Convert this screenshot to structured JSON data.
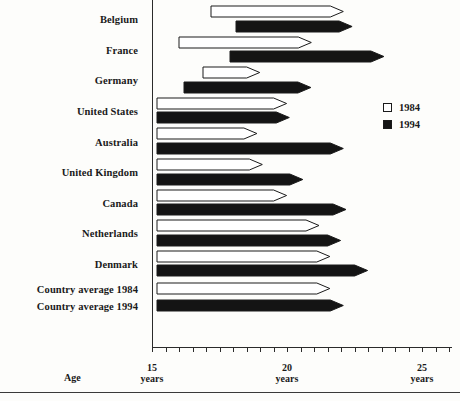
{
  "chart_data": {
    "type": "bar",
    "title": "",
    "subtitle": "",
    "orientation": "horizontal",
    "xlabel": "Age",
    "ylabel": "",
    "xlim": [
      15,
      26
    ],
    "x_tick_values": [
      15,
      20,
      25
    ],
    "x_tick_labels": [
      "15\nyears",
      "20\nyears",
      "25\nyears"
    ],
    "x_minor_tick_step": 0.5,
    "grid": false,
    "legend_position": "right",
    "legend": [
      {
        "label": "1984",
        "style": "open"
      },
      {
        "label": "1994",
        "style": "filled"
      }
    ],
    "categories": [
      "Belgium",
      "France",
      "Germany",
      "United States",
      "Australia",
      "United Kingdom",
      "Canada",
      "Netherlands",
      "Denmark",
      "Country average 1984",
      "Country average 1994"
    ],
    "series": [
      {
        "name": "1984",
        "style": "open",
        "values": [
          {
            "category": "Belgium",
            "start": 17.2,
            "end": 22.1
          },
          {
            "category": "France",
            "start": 16.0,
            "end": 20.9
          },
          {
            "category": "Germany",
            "start": 16.9,
            "end": 19.0
          },
          {
            "category": "United States",
            "start": 15.2,
            "end": 20.0
          },
          {
            "category": "Australia",
            "start": 15.2,
            "end": 18.9
          },
          {
            "category": "United Kingdom",
            "start": 15.2,
            "end": 19.1
          },
          {
            "category": "Canada",
            "start": 15.2,
            "end": 20.0
          },
          {
            "category": "Netherlands",
            "start": 15.2,
            "end": 21.2
          },
          {
            "category": "Denmark",
            "start": 15.2,
            "end": 21.6
          },
          {
            "category": "Country average 1984",
            "start": 15.2,
            "end": 21.6
          },
          {
            "category": "Country average 1994",
            "start": null,
            "end": null
          }
        ]
      },
      {
        "name": "1994",
        "style": "filled",
        "values": [
          {
            "category": "Belgium",
            "start": 18.1,
            "end": 22.4
          },
          {
            "category": "France",
            "start": 17.9,
            "end": 23.6
          },
          {
            "category": "Germany",
            "start": 16.2,
            "end": 20.9
          },
          {
            "category": "United States",
            "start": 15.2,
            "end": 20.1
          },
          {
            "category": "Australia",
            "start": 15.2,
            "end": 22.1
          },
          {
            "category": "United Kingdom",
            "start": 15.2,
            "end": 20.6
          },
          {
            "category": "Canada",
            "start": 15.2,
            "end": 22.2
          },
          {
            "category": "Netherlands",
            "start": 15.2,
            "end": 22.0
          },
          {
            "category": "Denmark",
            "start": 15.2,
            "end": 23.0
          },
          {
            "category": "Country average 1984",
            "start": null,
            "end": null
          },
          {
            "category": "Country average 1994",
            "start": 15.2,
            "end": 22.1
          }
        ]
      }
    ]
  }
}
